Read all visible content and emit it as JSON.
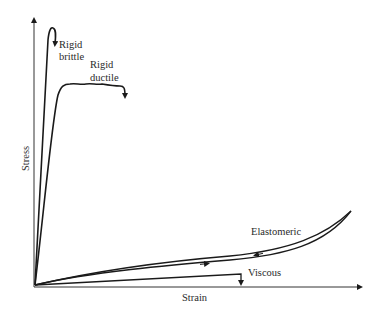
{
  "diagram": {
    "axes": {
      "x_label": "Strain",
      "y_label": "Stress"
    },
    "curves": [
      {
        "id": "rigid-brittle",
        "label_line1": "Rigid",
        "label_line2": "brittle"
      },
      {
        "id": "rigid-ductile",
        "label_line1": "Rigid",
        "label_line2": "ductile"
      },
      {
        "id": "elastomeric",
        "label": "Elastomeric"
      },
      {
        "id": "viscous",
        "label": "Viscous"
      }
    ],
    "colors": {
      "line": "#1a1a1a",
      "text": "#2a2a2a",
      "background": "#ffffff"
    }
  }
}
